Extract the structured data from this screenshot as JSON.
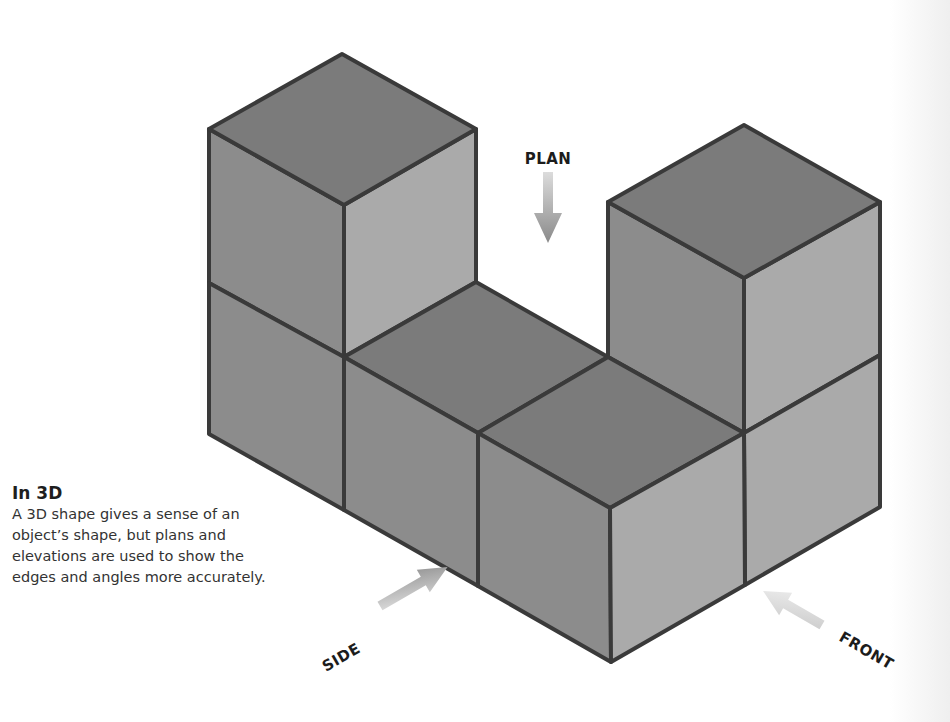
{
  "caption": {
    "title": "In 3D",
    "body": "A 3D shape gives a sense of an object’s shape, but plans and elevations are used to show the edges and angles more accurately."
  },
  "view_labels": {
    "plan": "PLAN",
    "side": "SIDE",
    "front": "FRONT"
  },
  "colors": {
    "top_face": "#7b7b7b",
    "left_face": "#8c8c8c",
    "right_face": "#aaaaaa",
    "edge": "#3a3a3a",
    "arrow": "#8a8a8a"
  },
  "shape": {
    "description": "U-shaped arrangement of 6 unit cubes: two 2-cube towers joined by two single cubes along the base",
    "cube_count": 6
  }
}
